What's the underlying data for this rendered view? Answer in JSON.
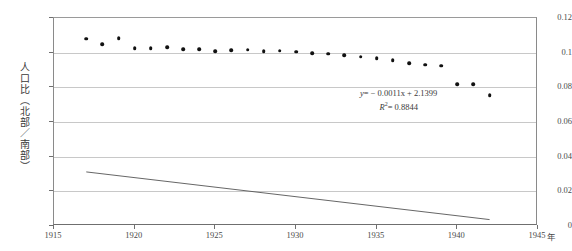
{
  "chart_data": {
    "type": "scatter",
    "title": "",
    "xlabel": "年",
    "ylabel": "人口比（北部／南部）",
    "xlim": [
      1915,
      1945
    ],
    "ylim": [
      0,
      0.12
    ],
    "grid": true,
    "legend": null,
    "xticks": [
      "1915",
      "1920",
      "1925",
      "1930",
      "1935",
      "1940",
      "1945"
    ],
    "xtick_values": [
      1915,
      1920,
      1925,
      1930,
      1935,
      1940,
      1945
    ],
    "yticks": [
      "0",
      "0.02",
      "0.04",
      "0.06",
      "0.08",
      "0.1",
      "0.12"
    ],
    "ytick_values": [
      0,
      0.02,
      0.04,
      0.06,
      0.08,
      0.1,
      0.12
    ],
    "x": [
      1917,
      1918,
      1919,
      1920,
      1921,
      1922,
      1923,
      1924,
      1925,
      1926,
      1927,
      1928,
      1929,
      1930,
      1931,
      1932,
      1933,
      1934,
      1935,
      1936,
      1937,
      1938,
      1939,
      1940,
      1941,
      1942
    ],
    "values": [
      0.108,
      0.1048,
      0.1082,
      0.1026,
      0.1025,
      0.1033,
      0.1021,
      0.1019,
      0.101,
      0.1014,
      0.1016,
      0.101,
      0.1012,
      0.1005,
      0.0998,
      0.0995,
      0.0985,
      0.0977,
      0.0968,
      0.0955,
      0.094,
      0.093,
      0.0925,
      0.0818,
      0.0818,
      0.0755
    ],
    "series": [
      {
        "name": "人口比（北部／南部）",
        "marker": "diamond",
        "color": "#111111",
        "x": [
          1917,
          1918,
          1919,
          1920,
          1921,
          1922,
          1923,
          1924,
          1925,
          1926,
          1927,
          1928,
          1929,
          1930,
          1931,
          1932,
          1933,
          1934,
          1935,
          1936,
          1937,
          1938,
          1939,
          1940,
          1941,
          1942
        ],
        "values": [
          0.108,
          0.1048,
          0.1082,
          0.1026,
          0.1025,
          0.1033,
          0.1021,
          0.1019,
          0.101,
          0.1014,
          0.1016,
          0.101,
          0.1012,
          0.1005,
          0.0998,
          0.0995,
          0.0985,
          0.0977,
          0.0968,
          0.0955,
          0.094,
          0.093,
          0.0925,
          0.0818,
          0.0818,
          0.0755
        ]
      }
    ],
    "trendline": {
      "type": "linear",
      "slope": -0.0011,
      "intercept": 2.1399,
      "r_squared": 0.8844,
      "x_start": 1917,
      "x_end": 1942,
      "color": "#555555"
    },
    "annotations": {
      "equation": "y = − 0.0011x + 2.1399",
      "equation_lhs": "y",
      "equation_rhs": "= − 0.0011x + 2.1399",
      "r_squared_label": "R",
      "r_squared_sup": "2",
      "r_squared_value": "= 0.8844"
    }
  },
  "axis": {
    "y_title": "人口比（北部／南部）",
    "x_unit": "年",
    "y_ticks": [
      {
        "label": "0.12",
        "value": 0.12
      },
      {
        "label": "0.1",
        "value": 0.1
      },
      {
        "label": "0.08",
        "value": 0.08
      },
      {
        "label": "0.06",
        "value": 0.06
      },
      {
        "label": "0.04",
        "value": 0.04
      },
      {
        "label": "0.02",
        "value": 0.02
      },
      {
        "label": "0",
        "value": 0
      }
    ],
    "x_ticks": [
      {
        "label": "1915",
        "value": 1915
      },
      {
        "label": "1920",
        "value": 1920
      },
      {
        "label": "1925",
        "value": 1925
      },
      {
        "label": "1930",
        "value": 1930
      },
      {
        "label": "1935",
        "value": 1935
      },
      {
        "label": "1940",
        "value": 1940
      },
      {
        "label": "1945",
        "value": 1945
      }
    ]
  },
  "header": {
    "title": ""
  }
}
